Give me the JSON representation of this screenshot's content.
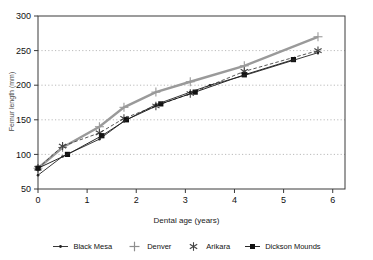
{
  "chart_data": {
    "type": "line",
    "title": "",
    "xlabel": "Dental age (years)",
    "ylabel": "Femur length (mm)",
    "xlim": [
      0,
      6.25
    ],
    "ylim": [
      50,
      300
    ],
    "xticks": [
      "0",
      "1",
      "2",
      "3",
      "4",
      "5",
      "6"
    ],
    "yticks": [
      "50",
      "100",
      "150",
      "200",
      "250",
      "300"
    ],
    "grid": "horizontal-dotted",
    "legend_position": "bottom",
    "series": [
      {
        "name": "Black Mesa",
        "color": "#222222",
        "marker": "small-dot",
        "line": "solid-thin",
        "x": [
          0.0,
          0.5,
          1.25,
          1.75,
          2.4,
          3.1,
          3.5,
          4.2,
          5.2,
          5.7
        ],
        "y": [
          70,
          97,
          122,
          148,
          172,
          190,
          200,
          214,
          236,
          247
        ]
      },
      {
        "name": "Denver",
        "color": "#9a9a9a",
        "marker": "plus",
        "line": "solid-thick",
        "x": [
          0.0,
          0.5,
          1.25,
          1.75,
          2.4,
          3.1,
          4.2,
          5.7
        ],
        "y": [
          80,
          110,
          140,
          168,
          190,
          205,
          228,
          270
        ]
      },
      {
        "name": "Arikara",
        "color": "#444444",
        "marker": "asterisk",
        "line": "dashed",
        "x": [
          0.0,
          0.5,
          1.25,
          1.75,
          2.4,
          3.1,
          4.2,
          5.7
        ],
        "y": [
          80,
          112,
          131,
          152,
          170,
          188,
          220,
          250
        ]
      },
      {
        "name": "Dickson Mounds",
        "color": "#111111",
        "marker": "square",
        "line": "solid-thin",
        "x": [
          0.0,
          0.6,
          1.3,
          1.8,
          2.5,
          3.2,
          4.2,
          5.2
        ],
        "y": [
          80,
          100,
          127,
          150,
          173,
          190,
          215,
          237
        ]
      }
    ]
  },
  "legend": {
    "items": [
      {
        "label": "Black Mesa",
        "marker": "small-dot-line"
      },
      {
        "label": "Denver",
        "marker": "plus"
      },
      {
        "label": "Arikara",
        "marker": "asterisk"
      },
      {
        "label": "Dickson Mounds",
        "marker": "square-line"
      }
    ]
  }
}
